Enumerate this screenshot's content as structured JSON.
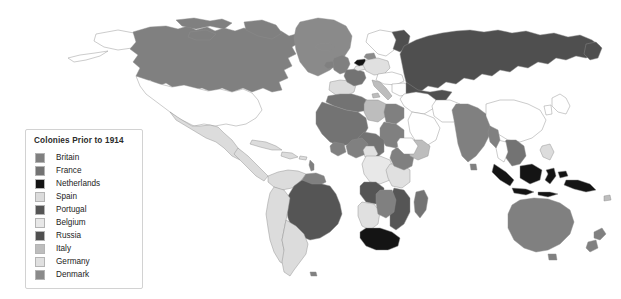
{
  "map": {
    "title": "Colonies Prior to 1914",
    "background_color": "#ffffff",
    "border_color": "#8c8c8c",
    "unclaimed_color": "#ffffff",
    "projection": "world-equirectangular"
  },
  "legend": {
    "title": "Colonies Prior to 1914",
    "background_color": "#ffffff",
    "border_color": "#d2d2d2",
    "items": [
      {
        "label": "Britain",
        "color": "#808080"
      },
      {
        "label": "France",
        "color": "#737373"
      },
      {
        "label": "Netherlands",
        "color": "#141414"
      },
      {
        "label": "Spain",
        "color": "#dcdcdc"
      },
      {
        "label": "Portugal",
        "color": "#555555"
      },
      {
        "label": "Belgium",
        "color": "#e8e8e8"
      },
      {
        "label": "Russia",
        "color": "#4f4f4f"
      },
      {
        "label": "Italy",
        "color": "#bdbdbd"
      },
      {
        "label": "Germany",
        "color": "#e0e0e0"
      },
      {
        "label": "Denmark",
        "color": "#8a8a8a"
      }
    ]
  },
  "regions": [
    {
      "name": "greenland",
      "power": "Denmark",
      "color": "#8a8a8a"
    },
    {
      "name": "canada",
      "power": "Britain",
      "color": "#808080"
    },
    {
      "name": "alaska",
      "power": "Russia",
      "color": "#ffffff"
    },
    {
      "name": "united-states",
      "power": "None",
      "color": "#ffffff"
    },
    {
      "name": "mexico",
      "power": "Spain",
      "color": "#dcdcdc"
    },
    {
      "name": "central-america",
      "power": "Spain",
      "color": "#dcdcdc"
    },
    {
      "name": "caribbean",
      "power": "Spain",
      "color": "#dcdcdc"
    },
    {
      "name": "brazil",
      "power": "Portugal",
      "color": "#555555"
    },
    {
      "name": "spanish-south-america",
      "power": "Spain",
      "color": "#dcdcdc"
    },
    {
      "name": "guianas",
      "power": "Britain",
      "color": "#808080"
    },
    {
      "name": "british-isles",
      "power": "Britain",
      "color": "#808080"
    },
    {
      "name": "france-metropole",
      "power": "France",
      "color": "#737373"
    },
    {
      "name": "iberia",
      "power": "Spain",
      "color": "#dcdcdc"
    },
    {
      "name": "germany-metropole",
      "power": "Germany",
      "color": "#e0e0e0"
    },
    {
      "name": "italy-metropole",
      "power": "Italy",
      "color": "#bdbdbd"
    },
    {
      "name": "netherlands-metropole",
      "power": "Netherlands",
      "color": "#141414"
    },
    {
      "name": "belgium-metropole",
      "power": "Belgium",
      "color": "#e8e8e8"
    },
    {
      "name": "denmark-metropole",
      "power": "Denmark",
      "color": "#8a8a8a"
    },
    {
      "name": "scandinavia",
      "power": "None",
      "color": "#ffffff"
    },
    {
      "name": "russian-empire",
      "power": "Russia",
      "color": "#4f4f4f"
    },
    {
      "name": "ottoman-arabia",
      "power": "None",
      "color": "#ffffff"
    },
    {
      "name": "persia",
      "power": "None",
      "color": "#ffffff"
    },
    {
      "name": "french-north-africa",
      "power": "France",
      "color": "#737373"
    },
    {
      "name": "libya",
      "power": "Italy",
      "color": "#bdbdbd"
    },
    {
      "name": "egypt-sudan",
      "power": "Britain",
      "color": "#808080"
    },
    {
      "name": "french-west-africa",
      "power": "France",
      "color": "#737373"
    },
    {
      "name": "nigeria",
      "power": "Britain",
      "color": "#808080"
    },
    {
      "name": "belgian-congo",
      "power": "Belgium",
      "color": "#e8e8e8"
    },
    {
      "name": "angola",
      "power": "Portugal",
      "color": "#555555"
    },
    {
      "name": "mozambique",
      "power": "Portugal",
      "color": "#555555"
    },
    {
      "name": "german-east-africa",
      "power": "Germany",
      "color": "#e0e0e0"
    },
    {
      "name": "german-south-west",
      "power": "Germany",
      "color": "#e0e0e0"
    },
    {
      "name": "east-africa-british",
      "power": "Britain",
      "color": "#808080"
    },
    {
      "name": "horn-of-africa",
      "power": "Italy",
      "color": "#bdbdbd"
    },
    {
      "name": "south-africa",
      "power": "Netherlands",
      "color": "#141414"
    },
    {
      "name": "madagascar",
      "power": "France",
      "color": "#737373"
    },
    {
      "name": "british-india",
      "power": "Britain",
      "color": "#808080"
    },
    {
      "name": "indochina",
      "power": "France",
      "color": "#737373"
    },
    {
      "name": "china",
      "power": "None",
      "color": "#ffffff"
    },
    {
      "name": "japan",
      "power": "None",
      "color": "#ffffff"
    },
    {
      "name": "dutch-east-indies",
      "power": "Netherlands",
      "color": "#141414"
    },
    {
      "name": "philippines",
      "power": "Spain",
      "color": "#dcdcdc"
    },
    {
      "name": "australia",
      "power": "Britain",
      "color": "#808080"
    },
    {
      "name": "new-zealand",
      "power": "Britain",
      "color": "#808080"
    },
    {
      "name": "new-guinea",
      "power": "Netherlands",
      "color": "#141414"
    }
  ]
}
